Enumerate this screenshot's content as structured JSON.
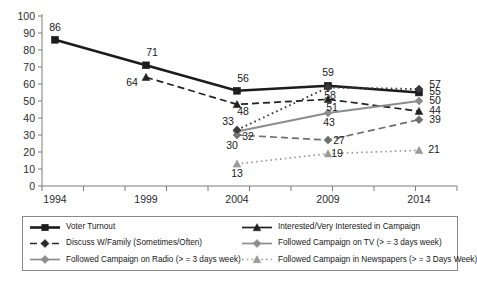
{
  "chart_data": {
    "type": "line",
    "title": "",
    "xlabel": "",
    "ylabel": "",
    "x": [
      "1994",
      "1999",
      "2004",
      "2009",
      "2014"
    ],
    "categories": [
      "1994",
      "1999",
      "2004",
      "2009",
      "2014"
    ],
    "ylim": [
      0,
      100
    ],
    "y_ticks": [
      0,
      10,
      20,
      30,
      40,
      50,
      60,
      70,
      80,
      90,
      100
    ],
    "grid": false,
    "legend_position": "bottom",
    "series": [
      {
        "name": "Voter Turnout",
        "marker": "square",
        "line_style": "solid",
        "color": "#1c1c1c",
        "x": [
          "1994",
          "1999",
          "2004",
          "2009",
          "2014"
        ],
        "values": [
          86,
          71,
          56,
          59,
          55
        ],
        "labels": [
          "86",
          "71",
          "56",
          "59",
          "55"
        ]
      },
      {
        "name": "Interested/Very Interested in Campaign",
        "marker": "triangle",
        "line_style": "dashed",
        "color": "#222222",
        "x": [
          "1999",
          "2004",
          "2009",
          "2014"
        ],
        "values": [
          64,
          48,
          51,
          44
        ],
        "labels": [
          "64",
          "48",
          "51",
          "44"
        ]
      },
      {
        "name": "Discuss W/Family (Sometimes/Often)",
        "marker": "diamond",
        "line_style": "dashed",
        "color": "#6f6f6f",
        "x": [
          "2004",
          "2009",
          "2014"
        ],
        "values": [
          30,
          27,
          39
        ],
        "labels": [
          "30",
          "27",
          "39"
        ]
      },
      {
        "name": "Followed Campaign on TV (> = 3 days week)",
        "marker": "diamond",
        "line_style": "solid",
        "color": "#8c8c8c",
        "x": [
          "2004",
          "2009",
          "2014"
        ],
        "values": [
          32,
          43,
          50
        ],
        "labels": [
          "32",
          "43",
          "50"
        ]
      },
      {
        "name": "Followed Campaign on Radio (> = 3 days week)",
        "marker": "diamond",
        "line_style": "dotted",
        "color": "#3a3a3a",
        "x": [
          "2004",
          "2009",
          "2014"
        ],
        "values": [
          33,
          58,
          57
        ],
        "labels": [
          "33",
          "58",
          "57"
        ]
      },
      {
        "name": "Followed Campaign in Newspapers (> = 3 Days Week)",
        "marker": "triangle",
        "line_style": "dotted",
        "color": "#9a9a9a",
        "x": [
          "2004",
          "2009",
          "2014"
        ],
        "values": [
          13,
          19,
          21
        ],
        "labels": [
          "13",
          "19",
          "21"
        ]
      }
    ]
  },
  "axis": {
    "y_labels": [
      "100",
      "90",
      "80",
      "70",
      "60",
      "50",
      "40",
      "30",
      "20",
      "10",
      "0"
    ],
    "x_labels": [
      "1994",
      "1999",
      "2004",
      "2009",
      "2014"
    ]
  },
  "legend": {
    "items": [
      {
        "label": "Voter Turnout",
        "marker": "square",
        "line_style": "solid",
        "color": "#1c1c1c"
      },
      {
        "label": "Interested/Very Interested in Campaign",
        "marker": "triangle",
        "line_style": "solid",
        "color": "#222222"
      },
      {
        "label": "Discuss W/Family (Sometimes/Often)",
        "marker": "diamond",
        "line_style": "dashed",
        "color": "#2a2a2a"
      },
      {
        "label": "Followed Campaign on TV (> = 3 days week)",
        "marker": "diamond",
        "line_style": "solid",
        "color": "#8c8c8c"
      },
      {
        "label": "Followed Campaign on Radio (> = 3 days week)",
        "marker": "diamond",
        "line_style": "solid",
        "color": "#8c8c8c"
      },
      {
        "label": "Followed Campaign in Newspapers (> = 3 Days Week)",
        "marker": "triangle",
        "line_style": "dotted",
        "color": "#9a9a9a"
      }
    ]
  }
}
